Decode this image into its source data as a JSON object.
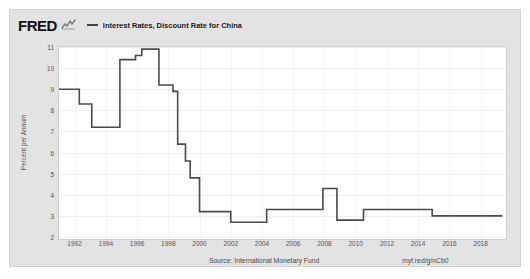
{
  "brand": {
    "logo_text": "FRED",
    "logo_mark": "squiggle-icon"
  },
  "legend": {
    "marker": "line-dash",
    "label": "Interest Rates, Discount Rate for China"
  },
  "footer": {
    "source": "Source: International Monetary Fund",
    "short_url": "myf.red/g/nCb0"
  },
  "colors": {
    "line": "#4a4a4a",
    "panel_background": "#ffffff",
    "card_background": "#e3e3e3",
    "gridline": "#f0f0f0",
    "text": "#555555"
  },
  "chart_data": {
    "type": "line",
    "title": "Interest Rates, Discount Rate for China",
    "xlabel": "",
    "ylabel": "Percent per Annum",
    "ylim": [
      2,
      11
    ],
    "xlim": [
      1991,
      2019.5
    ],
    "grid": true,
    "legend_position": "top",
    "yticks": [
      2,
      3,
      4,
      5,
      6,
      7,
      8,
      9,
      10,
      11
    ],
    "xticks": [
      1992,
      1994,
      1996,
      1998,
      2000,
      2002,
      2004,
      2006,
      2008,
      2010,
      2012,
      2014,
      2016,
      2018
    ],
    "step_style": "post",
    "series": [
      {
        "name": "Interest Rates, Discount Rate for China",
        "color": "#4a4a4a",
        "points": [
          [
            1991.0,
            9.0
          ],
          [
            1992.3,
            9.0
          ],
          [
            1992.3,
            8.3
          ],
          [
            1993.1,
            8.3
          ],
          [
            1993.1,
            7.2
          ],
          [
            1994.9,
            7.2
          ],
          [
            1994.9,
            10.4
          ],
          [
            1995.9,
            10.4
          ],
          [
            1995.9,
            10.6
          ],
          [
            1996.3,
            10.6
          ],
          [
            1996.3,
            10.9
          ],
          [
            1997.4,
            10.9
          ],
          [
            1997.4,
            9.2
          ],
          [
            1998.3,
            9.2
          ],
          [
            1998.3,
            8.9
          ],
          [
            1998.6,
            8.9
          ],
          [
            1998.6,
            6.4
          ],
          [
            1999.1,
            6.4
          ],
          [
            1999.1,
            5.6
          ],
          [
            1999.4,
            5.6
          ],
          [
            1999.4,
            4.8
          ],
          [
            2000.0,
            4.8
          ],
          [
            2000.0,
            3.2
          ],
          [
            2002.0,
            3.2
          ],
          [
            2002.0,
            2.7
          ],
          [
            2004.3,
            2.7
          ],
          [
            2004.3,
            3.3
          ],
          [
            2007.9,
            3.3
          ],
          [
            2007.9,
            4.3
          ],
          [
            2008.8,
            4.3
          ],
          [
            2008.8,
            2.8
          ],
          [
            2010.5,
            2.8
          ],
          [
            2010.5,
            3.3
          ],
          [
            2014.9,
            3.3
          ],
          [
            2014.9,
            3.0
          ],
          [
            2019.4,
            3.0
          ]
        ]
      }
    ]
  }
}
